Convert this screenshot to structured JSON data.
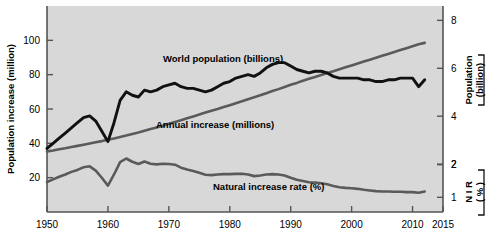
{
  "figure": {
    "background": "#ffffff",
    "plot_background": "#d8d8d8",
    "frame_color": "#555555"
  },
  "axes": {
    "left": {
      "title": "Population increase (million)",
      "ticks": [
        "20",
        "40",
        "60",
        "80",
        "100"
      ],
      "min": 0,
      "max": 120
    },
    "right_upper": {
      "title_line1": "Population",
      "title_line2": "(billion)",
      "ticks": [
        "2",
        "4",
        "6",
        "8"
      ],
      "min": 0,
      "max": 8.6
    },
    "right_lower": {
      "title_line1": "N I R",
      "title_line2": "( % )",
      "ticks": [
        "1",
        "2"
      ]
    },
    "bottom": {
      "ticks": [
        "1950",
        "1960",
        "1970",
        "1980",
        "1990",
        "2000",
        "2010",
        "2015"
      ],
      "min": 1950,
      "max": 2015
    }
  },
  "series_labels": {
    "world_population": "World population (billions)",
    "annual_increase": "Annual increase (millions)",
    "natural_increase_rate": "Natural increase rate (%)"
  },
  "chart_data": {
    "type": "line",
    "title": "",
    "xlabel": "",
    "ylabel": "Population increase (million)",
    "xlim": [
      1950,
      2015
    ],
    "ylim": [
      0,
      120
    ],
    "grid": false,
    "legend": "inline annotations",
    "colors": {
      "world_population": "#5a5a5a",
      "annual_increase": "#111111",
      "natural_increase_rate": "#5a5a5a"
    },
    "x": [
      1950,
      1951,
      1952,
      1953,
      1954,
      1955,
      1956,
      1957,
      1958,
      1959,
      1960,
      1961,
      1962,
      1963,
      1964,
      1965,
      1966,
      1967,
      1968,
      1969,
      1970,
      1971,
      1972,
      1973,
      1974,
      1975,
      1976,
      1977,
      1978,
      1979,
      1980,
      1981,
      1982,
      1983,
      1984,
      1985,
      1986,
      1987,
      1988,
      1989,
      1990,
      1991,
      1992,
      1993,
      1994,
      1995,
      1996,
      1997,
      1998,
      1999,
      2000,
      2001,
      2002,
      2003,
      2004,
      2005,
      2006,
      2007,
      2008,
      2009,
      2010,
      2011,
      2012
    ],
    "series": [
      {
        "name": "World population (billions)",
        "axis": "right_upper",
        "units": "billions",
        "values": [
          2.53,
          2.57,
          2.62,
          2.66,
          2.71,
          2.76,
          2.81,
          2.86,
          2.91,
          2.96,
          3.02,
          3.07,
          3.13,
          3.19,
          3.26,
          3.32,
          3.39,
          3.46,
          3.53,
          3.6,
          3.68,
          3.76,
          3.83,
          3.91,
          3.99,
          4.07,
          4.15,
          4.23,
          4.3,
          4.38,
          4.46,
          4.54,
          4.62,
          4.71,
          4.79,
          4.87,
          4.96,
          5.05,
          5.13,
          5.22,
          5.31,
          5.39,
          5.48,
          5.56,
          5.64,
          5.72,
          5.8,
          5.88,
          5.96,
          6.04,
          6.12,
          6.2,
          6.28,
          6.36,
          6.44,
          6.52,
          6.6,
          6.68,
          6.76,
          6.84,
          6.92,
          7.0,
          7.06
        ]
      },
      {
        "name": "Annual increase (millions)",
        "axis": "left",
        "units": "millions",
        "values": [
          37,
          40,
          43,
          46,
          49,
          52,
          55,
          56,
          53,
          47,
          41,
          52,
          65,
          70,
          68,
          67,
          71,
          70,
          71,
          73,
          74,
          75,
          73,
          72,
          72,
          71,
          70,
          71,
          73,
          75,
          76,
          78,
          79,
          80,
          79,
          81,
          84,
          86,
          87,
          87,
          85,
          83,
          82,
          81,
          82,
          82,
          81,
          79,
          78,
          78,
          78,
          78,
          77,
          77,
          76,
          76,
          77,
          77,
          78,
          78,
          78,
          73,
          77
        ]
      },
      {
        "name": "Natural increase rate (%)",
        "axis": "right_lower",
        "units": "percent",
        "values": [
          1.47,
          1.55,
          1.63,
          1.7,
          1.78,
          1.84,
          1.92,
          1.95,
          1.82,
          1.6,
          1.36,
          1.7,
          2.08,
          2.19,
          2.09,
          2.02,
          2.1,
          2.03,
          2.01,
          2.03,
          2.02,
          2.0,
          1.91,
          1.85,
          1.81,
          1.75,
          1.69,
          1.68,
          1.7,
          1.71,
          1.71,
          1.72,
          1.72,
          1.7,
          1.65,
          1.67,
          1.7,
          1.71,
          1.7,
          1.67,
          1.6,
          1.54,
          1.5,
          1.46,
          1.45,
          1.43,
          1.4,
          1.35,
          1.31,
          1.29,
          1.28,
          1.26,
          1.23,
          1.21,
          1.19,
          1.18,
          1.18,
          1.17,
          1.17,
          1.16,
          1.16,
          1.14,
          1.18
        ]
      }
    ]
  }
}
